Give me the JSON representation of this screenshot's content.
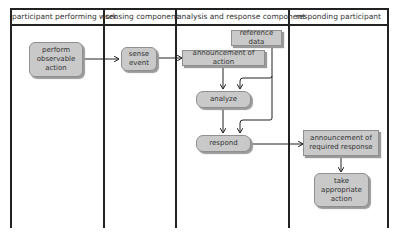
{
  "lanes": [
    {
      "title": "participant performing work"
    },
    {
      "title": "sensing component"
    },
    {
      "title": "analysis and response component"
    },
    {
      "title": "responding participant"
    }
  ],
  "nodes": {
    "perform_action": "perform observable action",
    "perform_action_lines": [
      "perform",
      "observable",
      "action"
    ],
    "sense_event_lines": [
      "sense",
      "event"
    ],
    "reference_data": "reference data",
    "announcement_of_action": "announcement of action",
    "analyze": "analyze",
    "respond": "respond",
    "announcement_required_lines": [
      "announcement of",
      "required response"
    ],
    "take_action_lines": [
      "take",
      "appropriate",
      "action"
    ]
  },
  "colors": {
    "node_fill": "#c9c9c9",
    "node_border": "#8f8f8f",
    "line": "#222222"
  }
}
